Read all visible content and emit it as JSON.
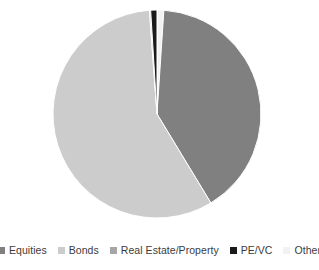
{
  "chart_data": {
    "type": "pie",
    "title": "",
    "subtitle": "",
    "xlabel": "",
    "ylabel": "",
    "grid": false,
    "legend_position": "bottom",
    "start_angle_deg": 0,
    "direction": "clockwise",
    "categories": [
      "Equities",
      "Bonds",
      "Real Estate/Property",
      "PE/VC",
      "Other"
    ],
    "values": [
      40.3,
      57.5,
      0.2,
      1.0,
      1.0
    ],
    "labels_shown": false,
    "slices": [
      {
        "name": "Equities",
        "value": 40.3,
        "angle_deg": 145.0,
        "color": "#808080"
      },
      {
        "name": "Bonds",
        "value": 57.5,
        "angle_deg": 207.0,
        "color": "#cccccc"
      },
      {
        "name": "Real Estate/Property",
        "value": 0.2,
        "angle_deg": 0.7,
        "color": "#a6a6a6"
      },
      {
        "name": "PE/VC",
        "value": 1.0,
        "angle_deg": 3.5,
        "color": "#1a1a1a"
      },
      {
        "name": "Other",
        "value": 1.0,
        "angle_deg": 3.8,
        "color": "#f2f2f2"
      }
    ]
  },
  "legend": {
    "items": [
      {
        "label": "Equities",
        "color": "#808080"
      },
      {
        "label": "Bonds",
        "color": "#cccccc"
      },
      {
        "label": "Real Estate/Property",
        "color": "#a6a6a6"
      },
      {
        "label": "PE/VC",
        "color": "#1a1a1a"
      },
      {
        "label": "Other",
        "color": "#f2f2f2"
      }
    ]
  },
  "geometry": {
    "center_x": 157,
    "center_y": 114,
    "radius": 104
  },
  "colors": {
    "background": "#ffffff",
    "legend_text": "#3c3c3c",
    "slice_outline": "#ffffff"
  }
}
